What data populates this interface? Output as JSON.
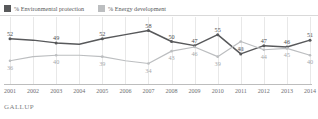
{
  "legend": {
    "items": [
      {
        "label": "% Environmental protection",
        "color": "#58595b",
        "key": "environmental_protection"
      },
      {
        "label": "% Energy development",
        "color": "#bcbec0",
        "key": "energy_development"
      }
    ]
  },
  "footer": {
    "brand": "GALLUP"
  },
  "chart_data": {
    "type": "line",
    "title": "",
    "subtitle": "",
    "xlabel": "",
    "ylabel": "",
    "grid": true,
    "legend_position": "top-left",
    "ylim": [
      30,
      62
    ],
    "categories": [
      "2001",
      "2002",
      "2003",
      "2004",
      "2005",
      "2006",
      "2007",
      "2008",
      "2009",
      "2010",
      "2011",
      "2012",
      "2013",
      "2014"
    ],
    "series": [
      {
        "name": "% Environmental protection",
        "color": "#58595b",
        "values": [
          52,
          51,
          49,
          48,
          52,
          55,
          58,
          50,
          47,
          55,
          41,
          47,
          46,
          51
        ],
        "labels": [
          "52",
          "",
          "49",
          "",
          "52",
          "",
          "58",
          "50",
          "47",
          "55",
          "41",
          "47",
          "46",
          "51"
        ]
      },
      {
        "name": "% Energy development",
        "color": "#bcbec0",
        "values": [
          36,
          39,
          40,
          40,
          39,
          36,
          34,
          43,
          46,
          39,
          50,
          44,
          45,
          40
        ],
        "labels": [
          "36",
          "",
          "40",
          "",
          "39",
          "",
          "34",
          "43",
          "46",
          "39",
          "50",
          "44",
          "45",
          "40"
        ]
      }
    ]
  }
}
